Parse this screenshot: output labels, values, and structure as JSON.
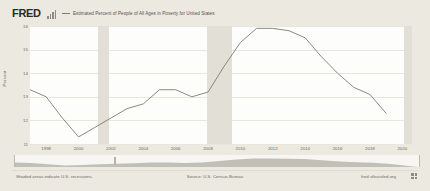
{
  "header": {
    "logo_text": "FRED",
    "logo_bars_icon": "bar-chart-icon",
    "legend_label": "Estimated Percent of People of All Ages in Poverty for United States",
    "legend_color": "#7e7c72"
  },
  "footer": {
    "left_note": "Shaded areas indicate U.S. recessions.",
    "source_note": "Source: U.S. Census Bureau",
    "site_note": "fred.stlouisfed.org",
    "mark_icon": "fred-squares-icon"
  },
  "range_selector": {
    "handle_icon": "range-handle-icon",
    "selection_start_pct": 0.0,
    "selection_end_pct": 100.0
  },
  "chart_data": {
    "type": "line",
    "title": "",
    "xlabel": "",
    "ylabel": "Percent",
    "xlim": [
      1997,
      2020.6
    ],
    "ylim": [
      11,
      16
    ],
    "yticks": [
      11,
      12,
      13,
      14,
      15,
      16
    ],
    "ytick_labels": [
      "11",
      "12",
      "13",
      "14",
      "15",
      "16"
    ],
    "xticks": [
      1998,
      2000,
      2002,
      2004,
      2006,
      2008,
      2010,
      2012,
      2014,
      2016,
      2018,
      2020
    ],
    "xtick_labels": [
      "1998",
      "2000",
      "2002",
      "2004",
      "2006",
      "2008",
      "2010",
      "2012",
      "2014",
      "2016",
      "2018",
      "2020"
    ],
    "grid": true,
    "legend_position": "top",
    "line_color": "#7e7c72",
    "recession_color": "#e2e0d6",
    "recessions": [
      {
        "start": 2001.2,
        "end": 2001.9
      },
      {
        "start": 2007.95,
        "end": 2009.45
      },
      {
        "start": 2020.1,
        "end": 2020.6
      }
    ],
    "series": [
      {
        "name": "Estimated Percent of People of All Ages in Poverty for United States",
        "x": [
          1997,
          1998,
          1999,
          2000,
          2001,
          2002,
          2003,
          2004,
          2005,
          2006,
          2007,
          2008,
          2009,
          2010,
          2011,
          2012,
          2013,
          2014,
          2015,
          2016,
          2017,
          2018,
          2019
        ],
        "values": [
          13.3,
          13.0,
          12.1,
          11.3,
          11.7,
          12.1,
          12.5,
          12.7,
          13.3,
          13.3,
          13.0,
          13.2,
          14.3,
          15.3,
          15.9,
          15.9,
          15.8,
          15.5,
          14.7,
          14.0,
          13.4,
          13.1,
          12.3
        ]
      }
    ]
  }
}
